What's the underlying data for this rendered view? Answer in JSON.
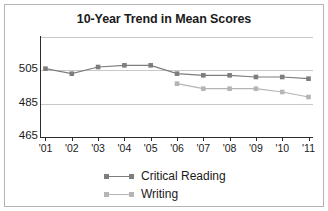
{
  "figure": {
    "title": "10-Year Trend in Mean Scores"
  },
  "legend": {
    "items": [
      {
        "label": "Critical Reading",
        "color": "#7d7d7d",
        "icon": "line-marker-icon"
      },
      {
        "label": "Writing",
        "color": "#b5b5b5",
        "icon": "line-marker-icon"
      }
    ]
  },
  "chart_data": {
    "type": "line",
    "title": "10-Year Trend in Mean Scores",
    "xlabel": "",
    "ylabel": "",
    "x": [
      "'01",
      "'02",
      "'03",
      "'04",
      "'05",
      "'06",
      "'07",
      "'08",
      "'09",
      "'10",
      "'11"
    ],
    "categories": [
      "'01",
      "'02",
      "'03",
      "'04",
      "'05",
      "'06",
      "'07",
      "'08",
      "'09",
      "'10",
      "'11"
    ],
    "ylim": [
      465,
      525
    ],
    "yticks": [
      465,
      485,
      505
    ],
    "ytick_labels": [
      "465",
      "485",
      "505"
    ],
    "grid": true,
    "gridlines_at": [
      485,
      505,
      525
    ],
    "legend_position": "bottom-center",
    "series": [
      {
        "name": "Critical Reading",
        "color": "#7d7d7d",
        "marker": "square",
        "values": [
          506,
          503,
          507,
          508,
          508,
          503,
          502,
          502,
          501,
          501,
          500
        ]
      },
      {
        "name": "Writing",
        "color": "#b5b5b5",
        "marker": "square",
        "values": [
          null,
          null,
          null,
          null,
          null,
          497,
          494,
          494,
          494,
          492,
          489
        ]
      }
    ]
  },
  "axes": {
    "y_tick_labels": [
      "505",
      "485",
      "465"
    ],
    "x_tick_labels": [
      "'01",
      "'02",
      "'03",
      "'04",
      "'05",
      "'06",
      "'07",
      "'08",
      "'09",
      "'10",
      "'11"
    ]
  }
}
